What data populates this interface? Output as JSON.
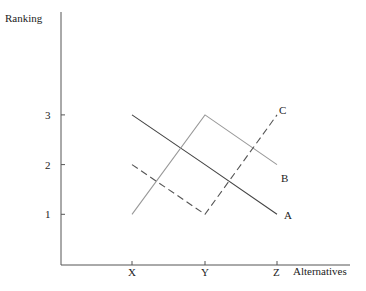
{
  "chart_data": {
    "type": "line",
    "title": "",
    "xlabel": "Alternatives",
    "ylabel": "Ranking",
    "categories": [
      "X",
      "Y",
      "Z"
    ],
    "yticks": [
      "1",
      "2",
      "3"
    ],
    "ylim": [
      0,
      4.6
    ],
    "grid": false,
    "legend": "inline labels at line ends",
    "series": [
      {
        "name": "A",
        "values": [
          3,
          2,
          1
        ],
        "style": "solid",
        "color": "#444444"
      },
      {
        "name": "B",
        "values": [
          1,
          3,
          2
        ],
        "style": "solid",
        "color": "#999999"
      },
      {
        "name": "C",
        "values": [
          2,
          1,
          3
        ],
        "style": "dashed",
        "color": "#555555"
      }
    ]
  }
}
